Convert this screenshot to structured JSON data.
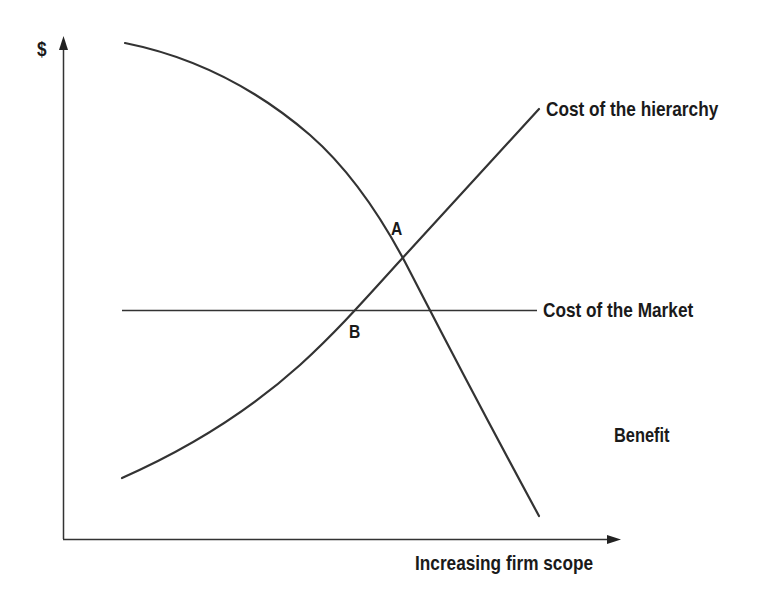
{
  "diagram": {
    "title": "",
    "y_axis": {
      "label": "$"
    },
    "x_axis": {
      "label": "Increasing firm scope"
    },
    "curves": [
      {
        "id": "benefit",
        "label": "Benefit",
        "shape": "concave-down decreasing"
      },
      {
        "id": "cost_hierarchy",
        "label": "Cost of the hierarchy",
        "shape": "convex increasing"
      },
      {
        "id": "cost_market",
        "label": "Cost of the Market",
        "shape": "horizontal constant"
      }
    ],
    "points": [
      {
        "id": "A",
        "label": "A",
        "description": "intersection of Benefit and Cost of the hierarchy"
      },
      {
        "id": "B",
        "label": "B",
        "description": "intersection of Cost of the hierarchy and Cost of the Market"
      }
    ],
    "colors": {
      "line": "#333333",
      "text": "#1a1a1a",
      "background": "#ffffff"
    }
  }
}
